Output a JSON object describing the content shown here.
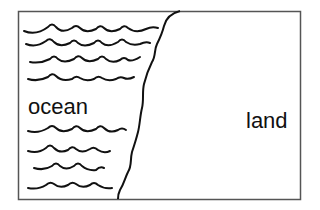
{
  "diagram": {
    "regions": [
      {
        "id": "ocean",
        "label": "ocean"
      },
      {
        "id": "land",
        "label": "land"
      }
    ],
    "colors": {
      "frame": "#555555",
      "stroke": "#111111",
      "background": "#ffffff"
    },
    "icons": {
      "waves": "wave-lines",
      "coastline": "coastline-curve"
    }
  }
}
